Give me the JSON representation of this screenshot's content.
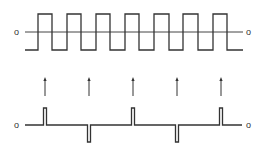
{
  "diagram": {
    "type": "waveform-differentiation",
    "square_wave": {
      "zero_label_left": "o",
      "zero_label_right": "o",
      "x_start": 25,
      "x_end": 243,
      "high_y": 14,
      "low_y": 50,
      "zero_y": 32,
      "edges_x": [
        38,
        52,
        67,
        81,
        96,
        110,
        125,
        139,
        154,
        169,
        183,
        198,
        213,
        227
      ],
      "start_level": "low"
    },
    "arrows": {
      "x": [
        45,
        89,
        133,
        177,
        221
      ],
      "y_top": 77,
      "y_bottom": 96,
      "direction": "up"
    },
    "impulse_train": {
      "zero_label_left": "o",
      "zero_label_right": "o",
      "baseline_y": 125,
      "x_start": 25,
      "x_end": 242,
      "pulses": [
        {
          "x": 45,
          "polarity": "positive"
        },
        {
          "x": 89,
          "polarity": "negative"
        },
        {
          "x": 133,
          "polarity": "positive"
        },
        {
          "x": 177,
          "polarity": "negative"
        },
        {
          "x": 221,
          "polarity": "positive"
        }
      ],
      "pulse_height": 17,
      "pulse_width": 3
    },
    "stroke_color": "#333333",
    "background_color": "#ffffff"
  }
}
